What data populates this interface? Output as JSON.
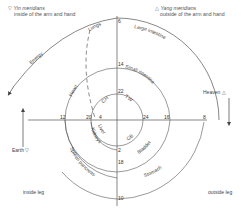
{
  "legend": {
    "yin": {
      "symbol": "▽",
      "title": "Yin meridians",
      "subtitle": "inside of the arm and hand"
    },
    "yang": {
      "symbol": "△",
      "title": "Yang meridians",
      "subtitle": "outside of the arm and hand"
    }
  },
  "poles": {
    "heaven": {
      "label": "Heaven",
      "symbol": "△"
    },
    "earth": {
      "label": "Earth",
      "symbol": "▽"
    }
  },
  "legs": {
    "inside": "inside leg",
    "outside": "outside leg"
  },
  "flow": {
    "energy": "Energy"
  },
  "organs": {
    "lungs": "Lungs",
    "large_intestine": "Large intestine",
    "heart": "Heart",
    "small_intestine": "Small intestine",
    "ch": "CH",
    "tw": "TW",
    "liver": "Liver",
    "gb": "GB",
    "kidneys": "Kidneys",
    "bladder": "Bladder",
    "spleen": "Spleen pancreas",
    "stomach": "Stomach"
  },
  "numbers": {
    "n6": "6",
    "n14": "14",
    "n22": "22",
    "n24": "24",
    "n16": "16",
    "n8": "8",
    "n12": "12",
    "n20": "20",
    "n4": "4",
    "n2": "2",
    "n18": "18",
    "n10": "10"
  },
  "colors": {
    "line": "#555555",
    "text": "#444444",
    "background": "#ffffff"
  }
}
